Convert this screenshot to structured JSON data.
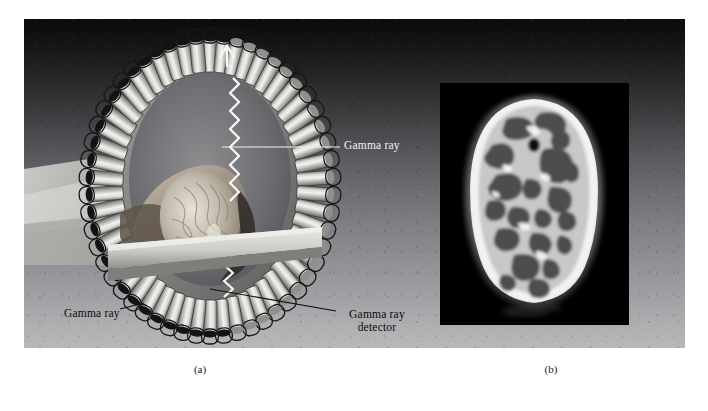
{
  "figure": {
    "panels": [
      {
        "id": "a",
        "caption": "(a)",
        "kind": "illustration",
        "description": "PET scanner ring with patient head inside"
      },
      {
        "id": "b",
        "caption": "(b)",
        "kind": "photograph",
        "description": "PET brain scan axial slice"
      }
    ],
    "annotations": [
      {
        "name": "gamma-ray-top",
        "text": "Gamma ray",
        "color": "#f2f2f2"
      },
      {
        "name": "gamma-ray-left",
        "text": "Gamma ray",
        "color": "#0c0c0c"
      },
      {
        "name": "gamma-ray-detector",
        "text_line1": "Gamma ray",
        "text_line2": "detector",
        "color": "#0c0c0c"
      }
    ],
    "colors": {
      "plate_top": "#0b0b0c",
      "plate_bottom": "#b8b8bb",
      "scan_background": "#000000",
      "page_background": "#ffffff"
    }
  }
}
